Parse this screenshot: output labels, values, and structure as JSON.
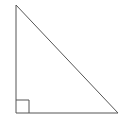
{
  "diagram": {
    "type": "right-triangle",
    "stroke_color": "#555555",
    "background": "#ffffff",
    "vertices": {
      "top": [
        16,
        5
      ],
      "bottom_left": [
        16,
        113
      ],
      "bottom_right": [
        118,
        113
      ]
    },
    "right_angle_marker": {
      "corner": "bottom_left",
      "size": 13
    }
  }
}
